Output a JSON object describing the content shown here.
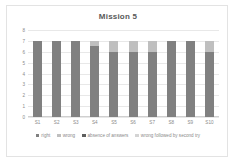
{
  "chart_data": {
    "type": "bar",
    "title": "Mission 5",
    "xlabel": "",
    "ylabel": "",
    "ylim": [
      0,
      8
    ],
    "yticks": [
      "0",
      "1",
      "2",
      "3",
      "4",
      "5",
      "6",
      "7",
      "8"
    ],
    "grid": true,
    "stacked": true,
    "legend_position": "bottom",
    "categories": [
      "S1",
      "S2",
      "S3",
      "S4",
      "S5",
      "S6",
      "S7",
      "S8",
      "S9",
      "S10"
    ],
    "series": [
      {
        "name": "right",
        "color": "#808080",
        "values": [
          7,
          7,
          7,
          6.5,
          6,
          6,
          6,
          7,
          7,
          6
        ]
      },
      {
        "name": "wrong",
        "color": "#bfbfbf",
        "values": [
          0,
          0,
          0,
          0.5,
          1,
          1,
          1,
          0,
          0,
          1
        ]
      },
      {
        "name": "absence of answers",
        "color": "#5e5e5e",
        "values": [
          0,
          0,
          0,
          0,
          0,
          0,
          0,
          0,
          0,
          0
        ]
      },
      {
        "name": "wrong followed by second try",
        "color": "#d4d4d4",
        "values": [
          0,
          0,
          0,
          0,
          0,
          0,
          0,
          0,
          0,
          0
        ]
      }
    ]
  }
}
